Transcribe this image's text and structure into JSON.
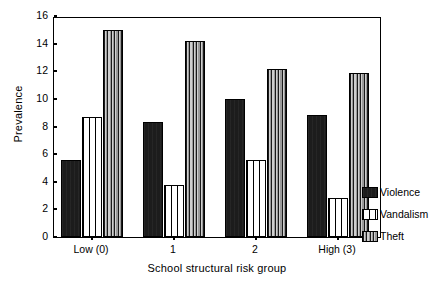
{
  "chart_data": {
    "type": "bar",
    "title": "",
    "xlabel": "School structural risk group",
    "ylabel": "Prevalence",
    "categories": [
      "Low (0)",
      "1",
      "2",
      "High (3)"
    ],
    "ylim": [
      0,
      16
    ],
    "yticks": [
      0,
      2,
      4,
      6,
      8,
      10,
      12,
      14,
      16
    ],
    "grid": false,
    "legend_position": "right",
    "series": [
      {
        "name": "Violence",
        "pattern": "solid-black",
        "color": "#1c1c1c",
        "values": [
          5.6,
          8.3,
          10.0,
          8.8
        ]
      },
      {
        "name": "Vandalism",
        "pattern": "white-vertical-stripes",
        "color": "#ffffff",
        "values": [
          8.7,
          3.8,
          5.6,
          2.8
        ]
      },
      {
        "name": "Theft",
        "pattern": "gray-vertical-stripes",
        "color": "#b4b4b4",
        "values": [
          15.0,
          14.2,
          12.2,
          11.9
        ]
      }
    ]
  },
  "axes": {
    "y_title": "Prevalence",
    "x_title": "School structural risk group",
    "y_tick_labels": [
      "0",
      "2",
      "4",
      "6",
      "8",
      "10",
      "12",
      "14",
      "16"
    ],
    "x_tick_labels": [
      "Low (0)",
      "1",
      "2",
      "High (3)"
    ]
  },
  "legend": {
    "items": [
      {
        "label": "Violence"
      },
      {
        "label": "Vandalism"
      },
      {
        "label": "Theft"
      }
    ]
  }
}
